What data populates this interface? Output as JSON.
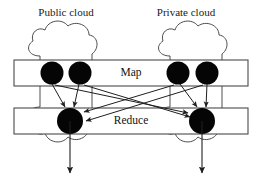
{
  "diagram": {
    "canvas": {
      "width": 263,
      "height": 189,
      "background": "#ffffff"
    },
    "clouds": [
      {
        "id": "public-cloud",
        "label": "Public cloud",
        "label_x": 66,
        "label_y": 16,
        "center_x": 70,
        "top": 20,
        "bottom": 176
      },
      {
        "id": "private-cloud",
        "label": "Private cloud",
        "label_x": 186,
        "label_y": 16,
        "center_x": 200,
        "top": 20,
        "bottom": 176
      }
    ],
    "stages": [
      {
        "id": "map-stage",
        "label": "Map",
        "label_x": 131,
        "label_y": 73,
        "bar_x": 14,
        "bar_y": 60,
        "bar_w": 234,
        "bar_h": 26
      },
      {
        "id": "reduce-stage",
        "label": "Reduce",
        "label_x": 131,
        "label_y": 121,
        "bar_x": 14,
        "bar_y": 108,
        "bar_w": 234,
        "bar_h": 26
      }
    ],
    "nodes": {
      "map": [
        {
          "id": "map-node-1",
          "cx": 52,
          "cy": 73,
          "r": 11.5,
          "cloud": "public-cloud"
        },
        {
          "id": "map-node-2",
          "cx": 80,
          "cy": 73,
          "r": 11.5,
          "cloud": "public-cloud"
        },
        {
          "id": "map-node-3",
          "cx": 178,
          "cy": 73,
          "r": 11.5,
          "cloud": "private-cloud"
        },
        {
          "id": "map-node-4",
          "cx": 207,
          "cy": 73,
          "r": 11.5,
          "cloud": "private-cloud"
        }
      ],
      "reduce": [
        {
          "id": "reduce-node-1",
          "cx": 70,
          "cy": 121,
          "r": 13,
          "cloud": "public-cloud"
        },
        {
          "id": "reduce-node-2",
          "cx": 202,
          "cy": 121,
          "r": 13,
          "cloud": "private-cloud"
        }
      ]
    },
    "shuffle_edges": [
      {
        "id": "edge-m1-r1",
        "from": "map-node-1",
        "to": "reduce-node-1",
        "x1": 52,
        "y1": 84,
        "x2": 65,
        "y2": 109
      },
      {
        "id": "edge-m1-r2",
        "from": "map-node-1",
        "to": "reduce-node-2",
        "x1": 54,
        "y1": 84,
        "x2": 190,
        "y2": 113
      },
      {
        "id": "edge-m2-r1",
        "from": "map-node-2",
        "to": "reduce-node-1",
        "x1": 79,
        "y1": 84,
        "x2": 74,
        "y2": 109
      },
      {
        "id": "edge-m2-r2",
        "from": "map-node-2",
        "to": "reduce-node-2",
        "x1": 83,
        "y1": 84,
        "x2": 191,
        "y2": 116
      },
      {
        "id": "edge-m3-r1",
        "from": "map-node-3",
        "to": "reduce-node-1",
        "x1": 175,
        "y1": 84,
        "x2": 83,
        "y2": 113
      },
      {
        "id": "edge-m3-r2",
        "from": "map-node-3",
        "to": "reduce-node-2",
        "x1": 180,
        "y1": 84,
        "x2": 199,
        "y2": 109
      },
      {
        "id": "edge-m4-r1",
        "from": "map-node-4",
        "to": "reduce-node-1",
        "x1": 204,
        "y1": 84,
        "x2": 84,
        "y2": 121
      },
      {
        "id": "edge-m4-r2",
        "from": "map-node-4",
        "to": "reduce-node-2",
        "x1": 207,
        "y1": 84,
        "x2": 206,
        "y2": 109
      }
    ],
    "output_arrows": [
      {
        "id": "output-arrow-left",
        "from": "reduce-node-1",
        "x": 70,
        "y1": 134,
        "y2": 176
      },
      {
        "id": "output-arrow-right",
        "from": "reduce-node-2",
        "x": 202,
        "y1": 134,
        "y2": 176
      }
    ],
    "colors": {
      "node_fill": "#050505",
      "bar_stroke": "#4a4a4a",
      "cloud_stroke": "#3a3a3a",
      "edge_stroke": "#1f1f1f",
      "text": "#111111",
      "background": "#ffffff"
    }
  }
}
